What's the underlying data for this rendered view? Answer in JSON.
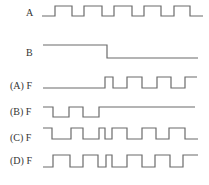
{
  "diagram": {
    "type": "timing-diagram",
    "line_color": "#6b6b6b",
    "signals": [
      {
        "id": "A",
        "label": "A",
        "label_pos": [
          26,
          8
        ],
        "high_y": 6,
        "low_y": 16,
        "start_x": 42,
        "end_x": 203,
        "initial": "low",
        "transitions": [
          55,
          72,
          84,
          102,
          114,
          132,
          144,
          161,
          174,
          190
        ]
      },
      {
        "id": "B",
        "label": "B",
        "label_pos": [
          26,
          48
        ],
        "high_y": 45,
        "low_y": 58,
        "start_x": 43,
        "end_x": 198,
        "initial": "high",
        "transitions": [
          107
        ]
      },
      {
        "id": "FA",
        "label": "(A) F",
        "label_pos": [
          10,
          81
        ],
        "high_y": 77,
        "low_y": 88,
        "start_x": 43,
        "end_x": 197,
        "initial": "low",
        "transitions": [
          105,
          113,
          127,
          142,
          157,
          171,
          185
        ]
      },
      {
        "id": "FB",
        "label": "(B) F",
        "label_pos": [
          10,
          107
        ],
        "high_y": 107,
        "low_y": 117,
        "start_x": 43,
        "end_x": 195,
        "initial": "high",
        "transitions": [
          53,
          69,
          83,
          99
        ]
      },
      {
        "id": "FC",
        "label": "(C) F",
        "label_pos": [
          10,
          133
        ],
        "high_y": 128,
        "low_y": 139,
        "start_x": 43,
        "end_x": 198,
        "initial": "high",
        "transitions": [
          52,
          71,
          83,
          99,
          105,
          112,
          127,
          142,
          156,
          169,
          185
        ]
      },
      {
        "id": "FD",
        "label": "(D) F",
        "label_pos": [
          10,
          156
        ],
        "high_y": 155,
        "low_y": 167,
        "start_x": 43,
        "end_x": 198,
        "initial": "low",
        "transitions": [
          53,
          70,
          83,
          98,
          106,
          112,
          127,
          142,
          155,
          170,
          183
        ]
      }
    ]
  }
}
